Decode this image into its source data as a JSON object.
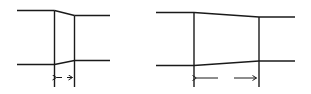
{
  "diagram": {
    "colors": {
      "line": "#1a1a1a",
      "background": "#ffffff"
    },
    "figures": [
      {
        "id": "short-transition",
        "upstream": {
          "x1": 17,
          "x2": 54,
          "top_y": 10.5,
          "bottom_y": 64.5
        },
        "transition": {
          "x_start": 54.5,
          "x_end": 74.5
        },
        "downstream": {
          "x1": 75,
          "x2": 110,
          "top_y": 15.5,
          "bottom_y": 60.5
        },
        "dimension": {
          "y": 77.5,
          "tick_bottom": 87,
          "label": ""
        }
      },
      {
        "id": "long-transition",
        "upstream": {
          "x1": 156,
          "x2": 194,
          "top_y": 12.5,
          "bottom_y": 65.5
        },
        "transition": {
          "x_start": 194,
          "x_end": 259
        },
        "downstream": {
          "x1": 259,
          "x2": 295,
          "top_y": 17,
          "bottom_y": 61
        },
        "dimension": {
          "y": 78,
          "tick_bottom": 87,
          "label": ""
        }
      }
    ]
  }
}
